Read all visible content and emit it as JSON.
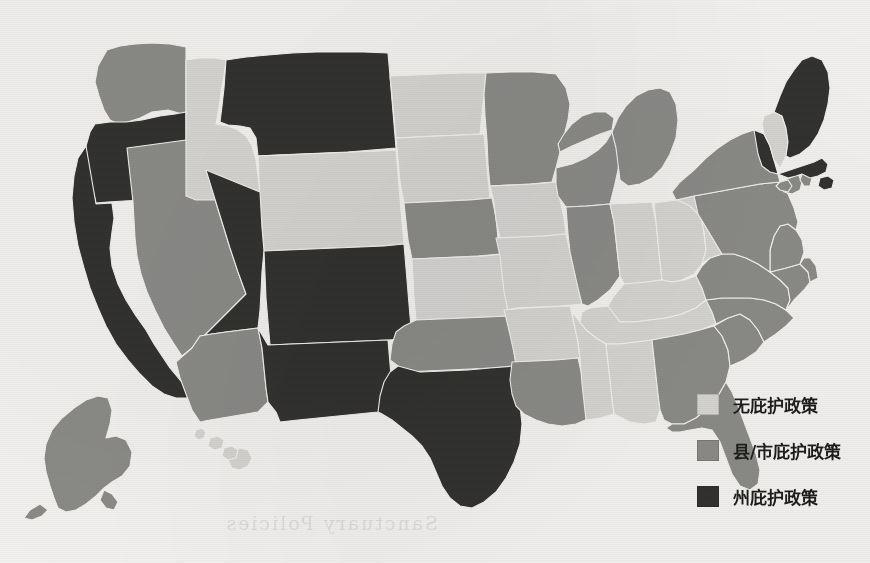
{
  "page": {
    "background_color": "#f3f2f0",
    "width": 870,
    "height": 563,
    "bleed_through_text": "Sanctuary Policies"
  },
  "legend": {
    "position": "bottom-right",
    "items": [
      {
        "label": "无庇护政策",
        "color": "#d6d5d2",
        "key": "none"
      },
      {
        "label": "县/市庇护政策",
        "color": "#8b8b88",
        "key": "county_city"
      },
      {
        "label": "州庇护政策",
        "color": "#323230",
        "key": "state"
      }
    ]
  },
  "chart_data": {
    "type": "map",
    "subtype": "choropleth",
    "title": "",
    "region": "United States",
    "projection": "albers-usa",
    "legend_position": "bottom-right",
    "categories": [
      "无庇护政策",
      "县/市庇护政策",
      "州庇护政策"
    ],
    "category_colors": [
      "#d6d5d2",
      "#8b8b88",
      "#323230"
    ],
    "values": {
      "AL": "无庇护政策",
      "AK": "县/市庇护政策",
      "AZ": "县/市庇护政策",
      "AR": "无庇护政策",
      "CA": "州庇护政策",
      "CO": "州庇护政策",
      "CT": "县/市庇护政策",
      "DE": "县/市庇护政策",
      "FL": "县/市庇护政策",
      "GA": "县/市庇护政策",
      "HI": "无庇护政策",
      "ID": "无庇护政策",
      "IL": "县/市庇护政策",
      "IN": "无庇护政策",
      "IA": "无庇护政策",
      "KS": "无庇护政策",
      "KY": "无庇护政策",
      "LA": "县/市庇护政策",
      "ME": "州庇护政策",
      "MD": "县/市庇护政策",
      "MA": "州庇护政策",
      "MI": "县/市庇护政策",
      "MN": "县/市庇护政策",
      "MS": "无庇护政策",
      "MO": "无庇护政策",
      "MT": "州庇护政策",
      "NE": "县/市庇护政策",
      "NV": "县/市庇护政策",
      "NH": "无庇护政策",
      "NJ": "县/市庇护政策",
      "NM": "州庇护政策",
      "NY": "县/市庇护政策",
      "NC": "县/市庇护政策",
      "ND": "无庇护政策",
      "OH": "无庇护政策",
      "OK": "县/市庇护政策",
      "OR": "州庇护政策",
      "PA": "县/市庇护政策",
      "RI": "县/市庇护政策",
      "SC": "县/市庇护政策",
      "SD": "无庇护政策",
      "TN": "无庇护政策",
      "TX": "州庇护政策",
      "UT": "州庇护政策",
      "VT": "州庇护政策",
      "VA": "县/市庇护政策",
      "WA": "县/市庇护政策",
      "WV": "无庇护政策",
      "WI": "县/市庇护政策",
      "WY": "无庇护政策"
    },
    "counts": {
      "无庇护政策": 17,
      "县/市庇护政策": 24,
      "州庇护政策": 9
    }
  }
}
